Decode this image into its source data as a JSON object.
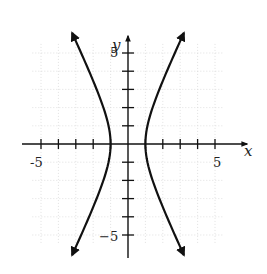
{
  "chart_data": {
    "type": "line",
    "title": "",
    "xlabel": "x",
    "ylabel": "y",
    "xlim": [
      -5.5,
      5.8
    ],
    "ylim": [
      -6.2,
      6.3
    ],
    "grid": true,
    "legend": null,
    "tick_labels": {
      "x": [
        "-5",
        "5"
      ],
      "y": [
        "5",
        "-5"
      ]
    },
    "x_ticks": [
      -5,
      -4,
      -3,
      -2,
      -1,
      1,
      2,
      3,
      4,
      5
    ],
    "y_ticks": [
      -5,
      -4,
      -3,
      -2,
      -1,
      1,
      2,
      3,
      4,
      5
    ],
    "equation": "x^2 - y^2/4 = 1",
    "series": [
      {
        "name": "left branch",
        "points": [
          [
            -3.2,
            6.1
          ],
          [
            -2.69,
            5
          ],
          [
            -2.24,
            4
          ],
          [
            -1.8,
            3
          ],
          [
            -1.41,
            2
          ],
          [
            -1.12,
            1
          ],
          [
            -1,
            0
          ],
          [
            -1.12,
            -1
          ],
          [
            -1.41,
            -2
          ],
          [
            -1.8,
            -3
          ],
          [
            -2.24,
            -4
          ],
          [
            -2.69,
            -5
          ],
          [
            -3.2,
            -6.1
          ]
        ]
      },
      {
        "name": "right branch",
        "points": [
          [
            3.2,
            6.1
          ],
          [
            2.69,
            5
          ],
          [
            2.24,
            4
          ],
          [
            1.8,
            3
          ],
          [
            1.41,
            2
          ],
          [
            1.12,
            1
          ],
          [
            1,
            0
          ],
          [
            1.12,
            -1
          ],
          [
            1.41,
            -2
          ],
          [
            1.8,
            -3
          ],
          [
            2.24,
            -4
          ],
          [
            2.69,
            -5
          ],
          [
            3.2,
            -6.1
          ]
        ]
      }
    ]
  },
  "labels": {
    "x_axis": "x",
    "y_axis": "y",
    "x_neg5": "-5",
    "x_pos5": "5",
    "y_pos5": "5",
    "y_neg5": "−5"
  }
}
